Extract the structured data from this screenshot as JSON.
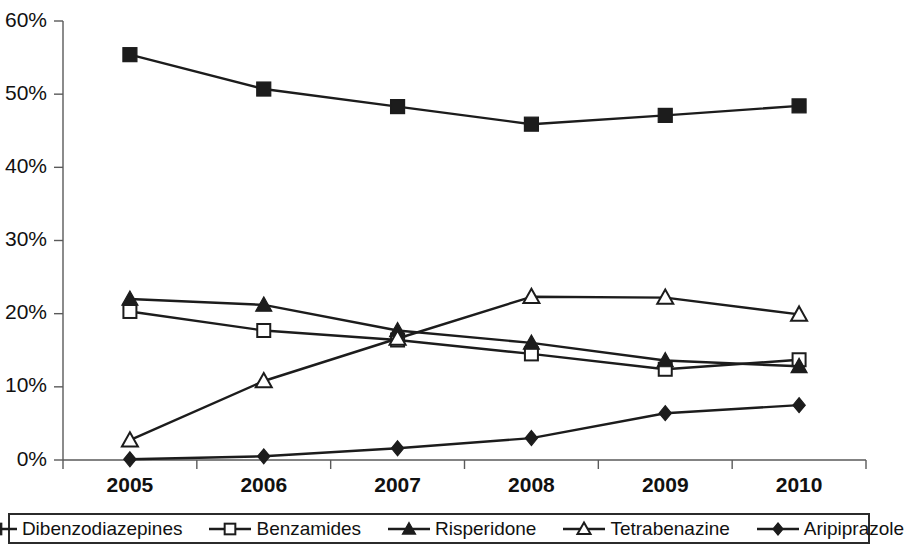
{
  "chart_data": {
    "type": "line",
    "title": "",
    "subtitle": "",
    "xlabel": "",
    "ylabel": "",
    "categories": [
      "2005",
      "2006",
      "2007",
      "2008",
      "2009",
      "2010"
    ],
    "x": [
      2005,
      2006,
      2007,
      2008,
      2009,
      2010
    ],
    "ylim": [
      0,
      60
    ],
    "yticks": [
      0,
      10,
      20,
      30,
      40,
      50,
      60
    ],
    "ytick_labels": [
      "0%",
      "10%",
      "20%",
      "30%",
      "40%",
      "50%",
      "60%"
    ],
    "xtick_labels": [
      "2005",
      "2006",
      "2007",
      "2008",
      "2009",
      "2010"
    ],
    "grid": false,
    "legend_position": "bottom",
    "value_unit": "%",
    "series": [
      {
        "name": "Dibenzodiazepines",
        "marker": "filled-square",
        "color": "#1c1c1c",
        "values": [
          55.4,
          50.7,
          48.3,
          45.9,
          47.1,
          48.4
        ]
      },
      {
        "name": "Benzamides",
        "marker": "open-square",
        "color": "#1c1c1c",
        "values": [
          20.3,
          17.7,
          16.4,
          14.5,
          12.4,
          13.7
        ]
      },
      {
        "name": "Risperidone",
        "marker": "filled-triangle",
        "color": "#1c1c1c",
        "values": [
          22.0,
          21.2,
          17.7,
          16.0,
          13.6,
          12.8
        ]
      },
      {
        "name": "Tetrabenazine",
        "marker": "open-triangle",
        "color": "#1c1c1c",
        "values": [
          2.7,
          10.8,
          16.6,
          22.3,
          22.2,
          19.9
        ]
      },
      {
        "name": "Aripiprazole",
        "marker": "filled-diamond",
        "color": "#1c1c1c",
        "values": [
          0.1,
          0.5,
          1.6,
          3.0,
          6.4,
          7.5
        ]
      }
    ]
  },
  "legend": {
    "items": [
      {
        "label": "Dibenzodiazepines",
        "marker": "filled-square"
      },
      {
        "label": "Benzamides",
        "marker": "open-square"
      },
      {
        "label": "Risperidone",
        "marker": "filled-triangle"
      },
      {
        "label": "Tetrabenazine",
        "marker": "open-triangle"
      },
      {
        "label": "Aripiprazole",
        "marker": "filled-diamond"
      }
    ]
  },
  "axes": {
    "y_tick_labels": [
      "60%",
      "50%",
      "40%",
      "30%",
      "20%",
      "10%",
      "0%"
    ],
    "x_tick_labels": [
      "2005",
      "2006",
      "2007",
      "2008",
      "2009",
      "2010"
    ]
  }
}
